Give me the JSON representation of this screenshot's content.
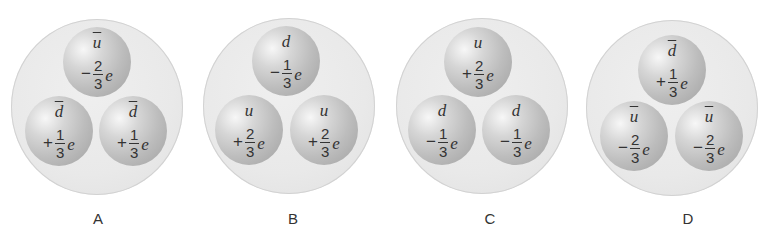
{
  "figure": {
    "options": [
      {
        "label": "A",
        "quarks": [
          {
            "symbol": "u",
            "antiparticle": true,
            "sign": "−",
            "numerator": "1",
            "denominator": "3",
            "display_num": "2",
            "unit": "e"
          },
          {
            "symbol": "d",
            "antiparticle": true,
            "sign": "+",
            "display_num": "1",
            "denominator": "3",
            "unit": "e"
          },
          {
            "symbol": "d",
            "antiparticle": true,
            "sign": "+",
            "display_num": "1",
            "denominator": "3",
            "unit": "e"
          }
        ]
      },
      {
        "label": "B",
        "quarks": [
          {
            "symbol": "d",
            "antiparticle": false,
            "sign": "−",
            "display_num": "1",
            "denominator": "3",
            "unit": "e"
          },
          {
            "symbol": "u",
            "antiparticle": false,
            "sign": "+",
            "display_num": "2",
            "denominator": "3",
            "unit": "e"
          },
          {
            "symbol": "u",
            "antiparticle": false,
            "sign": "+",
            "display_num": "2",
            "denominator": "3",
            "unit": "e"
          }
        ]
      },
      {
        "label": "C",
        "quarks": [
          {
            "symbol": "u",
            "antiparticle": false,
            "sign": "+",
            "display_num": "2",
            "denominator": "3",
            "unit": "e"
          },
          {
            "symbol": "d",
            "antiparticle": false,
            "sign": "−",
            "display_num": "1",
            "denominator": "3",
            "unit": "e"
          },
          {
            "symbol": "d",
            "antiparticle": false,
            "sign": "−",
            "display_num": "1",
            "denominator": "3",
            "unit": "e"
          }
        ]
      },
      {
        "label": "D",
        "quarks": [
          {
            "symbol": "d",
            "antiparticle": true,
            "sign": "+",
            "display_num": "1",
            "denominator": "3",
            "unit": "e"
          },
          {
            "symbol": "u",
            "antiparticle": true,
            "sign": "−",
            "display_num": "2",
            "denominator": "3",
            "unit": "e"
          },
          {
            "symbol": "u",
            "antiparticle": true,
            "sign": "−",
            "display_num": "2",
            "denominator": "3",
            "unit": "e"
          }
        ]
      }
    ]
  },
  "colors": {
    "outer_disc": "#e9e9e9",
    "sphere": "#bdbdbd",
    "text": "#333333"
  }
}
